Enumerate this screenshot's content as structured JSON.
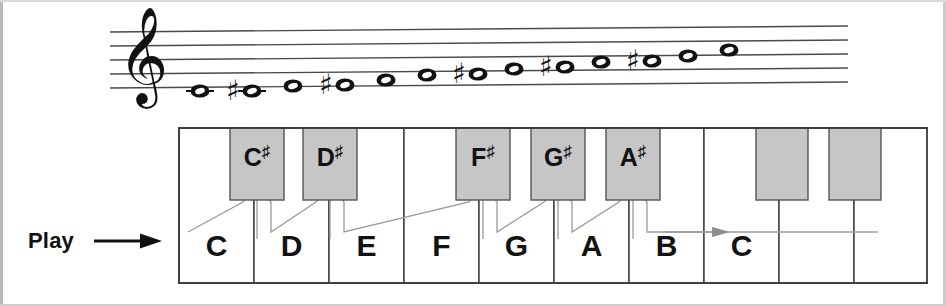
{
  "figure": {
    "play_label": "Play",
    "arrow_icon": "right-arrow"
  },
  "staff": {
    "clef": "treble-clef",
    "line_count": 5,
    "notes": [
      {
        "name": "C",
        "accidental": "",
        "x": 200,
        "y": 91,
        "ledger": true
      },
      {
        "name": "C#",
        "accidental": "#",
        "x": 252,
        "y": 91,
        "ledger": true
      },
      {
        "name": "D",
        "accidental": "",
        "x": 293,
        "y": 86,
        "ledger": false
      },
      {
        "name": "D#",
        "accidental": "#",
        "x": 345,
        "y": 85,
        "ledger": false
      },
      {
        "name": "E",
        "accidental": "",
        "x": 386,
        "y": 80,
        "ledger": false
      },
      {
        "name": "F",
        "accidental": "",
        "x": 427,
        "y": 75,
        "ledger": false
      },
      {
        "name": "F#",
        "accidental": "#",
        "x": 478,
        "y": 74,
        "ledger": false
      },
      {
        "name": "G",
        "accidental": "",
        "x": 514,
        "y": 69,
        "ledger": false
      },
      {
        "name": "G#",
        "accidental": "#",
        "x": 565,
        "y": 67,
        "ledger": false
      },
      {
        "name": "A",
        "accidental": "",
        "x": 601,
        "y": 62,
        "ledger": false
      },
      {
        "name": "A#",
        "accidental": "#",
        "x": 652,
        "y": 61,
        "ledger": false
      },
      {
        "name": "B",
        "accidental": "",
        "x": 688,
        "y": 56,
        "ledger": false
      },
      {
        "name": "C",
        "accidental": "",
        "x": 729,
        "y": 50,
        "ledger": false
      }
    ]
  },
  "keyboard": {
    "white_keys": [
      {
        "label": "C",
        "x": 0,
        "width": 75
      },
      {
        "label": "D",
        "x": 75,
        "width": 75
      },
      {
        "label": "E",
        "x": 150,
        "width": 75
      },
      {
        "label": "F",
        "x": 225,
        "width": 75
      },
      {
        "label": "G",
        "x": 300,
        "width": 75
      },
      {
        "label": "A",
        "x": 375,
        "width": 75
      },
      {
        "label": "B",
        "x": 450,
        "width": 75
      },
      {
        "label": "C",
        "x": 525,
        "width": 75
      },
      {
        "label": "",
        "x": 600,
        "width": 75
      },
      {
        "label": "",
        "x": 675,
        "width": 75
      }
    ],
    "black_keys": [
      {
        "label": "C#",
        "letter": "C",
        "x": 51,
        "width": 54
      },
      {
        "label": "D#",
        "letter": "D",
        "x": 124,
        "width": 54
      },
      {
        "label": "F#",
        "letter": "F",
        "x": 277,
        "width": 54
      },
      {
        "label": "G#",
        "letter": "G",
        "x": 352,
        "width": 54
      },
      {
        "label": "A#",
        "letter": "A",
        "x": 427,
        "width": 54
      },
      {
        "label": "",
        "letter": "",
        "x": 577,
        "width": 52
      },
      {
        "label": "",
        "letter": "",
        "x": 650,
        "width": 52
      }
    ],
    "black_key_fill": "#c6c6c6",
    "white_key_fill": "#ffffff",
    "outline_color": "#3a3a3a",
    "connector_color": "#9a9a9a",
    "target_key_label": "C"
  }
}
